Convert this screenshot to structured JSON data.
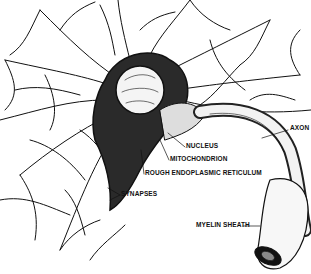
{
  "diagram": {
    "style": "black-and-white pen drawing",
    "colors": {
      "ink": "#111111",
      "background": "#ffffff"
    },
    "labels": [
      {
        "id": "axon",
        "text": "AXON",
        "x": 290,
        "y": 128
      },
      {
        "id": "nucleus",
        "text": "NUCLEUS",
        "x": 186,
        "y": 145
      },
      {
        "id": "mitochondrion",
        "text": "MITOCHONDRION",
        "x": 170,
        "y": 158
      },
      {
        "id": "rer",
        "text": "ROUGH ENDOPLASMIC RETICULUM",
        "x": 145,
        "y": 172
      },
      {
        "id": "synapses",
        "text": "SYNAPSES",
        "x": 121,
        "y": 193
      },
      {
        "id": "myelin",
        "text": "MYELIN SHEATH",
        "x": 196,
        "y": 223
      }
    ]
  }
}
